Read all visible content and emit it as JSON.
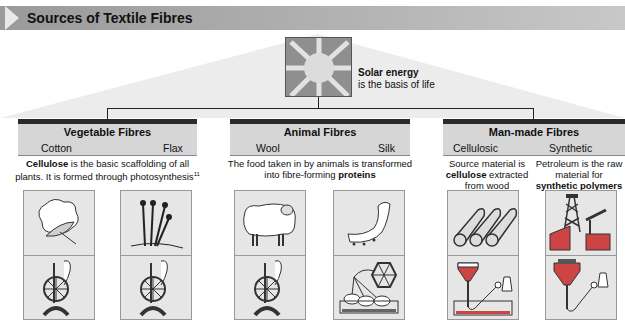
{
  "title": "Sources of Textile Fibres",
  "solar": {
    "heading": "Solar energy",
    "text": "is the basis of life"
  },
  "groups": [
    {
      "title": "Vegetable Fibres",
      "subs": [
        "Cotton",
        "Flax"
      ],
      "description": {
        "bold": "Cellulose",
        "text": " is the basic scaffolding of all plants. It is formed through photosynthesis",
        "sup": "11"
      }
    },
    {
      "title": "Animal Fibres",
      "subs": [
        "Wool",
        "Silk"
      ],
      "description": {
        "text": "The food taken in by animals is transformed into fibre-forming ",
        "bold": "proteins"
      }
    },
    {
      "title": "Man-made Fibres",
      "subs": [
        "Cellulosic",
        "Synthetic"
      ],
      "descriptions": [
        {
          "pre": "Source material is ",
          "bold": "cellulose",
          "post": " extracted from wood"
        },
        {
          "pre": "Petroleum is the raw material for ",
          "bold": "synthetic polymers",
          "post": ""
        }
      ]
    }
  ],
  "panels": [
    {
      "top": "cotton-boll",
      "bottom": "spinning-wheel"
    },
    {
      "top": "flax-plant",
      "bottom": "spinning-wheel"
    },
    {
      "top": "sheep",
      "bottom": "spinning-wheel"
    },
    {
      "top": "silkworm",
      "bottom": "silk-reel"
    },
    {
      "top": "wood-logs",
      "bottom": "spinneret-bath"
    },
    {
      "top": "oil-rig",
      "bottom": "melt-spinning"
    }
  ],
  "colors": {
    "title_bar": "#a8a8a8",
    "group_bar": "#2a2a2a",
    "group_head": "#d6d6d6",
    "panel_bg": "#e6e6e6",
    "sun_bg": "#8f8f8f"
  }
}
